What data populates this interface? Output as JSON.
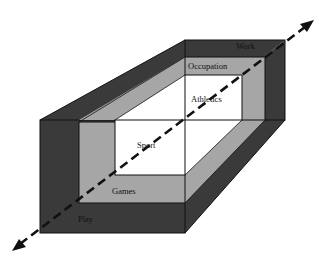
{
  "diagram": {
    "type": "nested 3D frame",
    "layers": [
      {
        "outer": "Work",
        "inner": "Play",
        "shade": "dark",
        "color": "#3a3a3a"
      },
      {
        "outer": "Occupation",
        "inner": "Games",
        "shade": "medium",
        "color": "#a6a6a6"
      },
      {
        "outer": "Athletics",
        "inner": "Sport",
        "shade": "light",
        "color": "#ffffff"
      }
    ],
    "labels": {
      "work": "Work",
      "occupation": "Occupation",
      "athletics": "Athletics",
      "sport": "Sport",
      "games": "Games",
      "play": "Play"
    },
    "axis": {
      "style": "dashed double-headed arrow",
      "color": "#111111"
    }
  }
}
